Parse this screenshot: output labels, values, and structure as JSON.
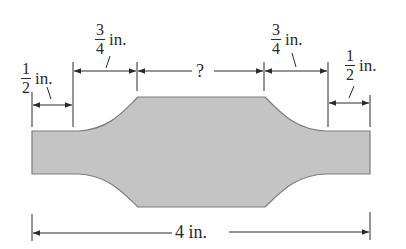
{
  "figure": {
    "type": "dimensioned-part-drawing",
    "shape_fill": "#c4c4c4",
    "shape_stroke": "#7a7a7a",
    "line_color": "#2a2a2a"
  },
  "dimensions": {
    "left_end": {
      "numerator": "1",
      "denominator": "2",
      "unit": "in."
    },
    "left_taper": {
      "numerator": "3",
      "denominator": "4",
      "unit": "in."
    },
    "center": {
      "label": "?"
    },
    "right_taper": {
      "numerator": "3",
      "denominator": "4",
      "unit": "in."
    },
    "right_end": {
      "numerator": "1",
      "denominator": "2",
      "unit": "in."
    },
    "overall": {
      "label": "4 in."
    }
  }
}
